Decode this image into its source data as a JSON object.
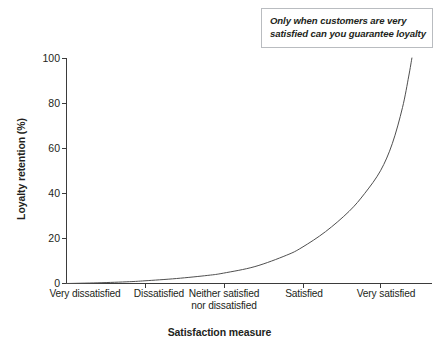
{
  "chart_data": {
    "type": "line",
    "title": "",
    "xlabel": "Satisfaction measure",
    "ylabel": "Loyalty retention (%)",
    "categories": [
      "Very dissatisfied",
      "Dissatisfied",
      "Neither satisfied nor dissatisfied",
      "Satisfied",
      "Very satisfied"
    ],
    "x": [
      1,
      2,
      3,
      4,
      5
    ],
    "values": [
      0,
      1,
      4,
      23,
      50
    ],
    "series": [
      {
        "name": "Loyalty retention",
        "values": [
          0,
          1,
          4,
          23,
          50
        ],
        "endpoint_value": 100,
        "color": "#4f4f4f"
      }
    ],
    "xlim": [
      0.75,
      5.4
    ],
    "ylim": [
      0,
      100
    ],
    "yticks": [
      0,
      20,
      40,
      60,
      80,
      100
    ],
    "ytick_labels": [
      "0",
      "20",
      "40",
      "60",
      "80",
      "100"
    ],
    "grid": false,
    "legend": "none",
    "curve_points": [
      {
        "x": 1.0,
        "y": 0.0
      },
      {
        "x": 1.4,
        "y": 0.3
      },
      {
        "x": 1.8,
        "y": 0.8
      },
      {
        "x": 2.0,
        "y": 1.2
      },
      {
        "x": 2.4,
        "y": 2.2
      },
      {
        "x": 2.8,
        "y": 3.6
      },
      {
        "x": 3.0,
        "y": 4.6
      },
      {
        "x": 3.4,
        "y": 7.5
      },
      {
        "x": 3.8,
        "y": 12.5
      },
      {
        "x": 4.0,
        "y": 16.0
      },
      {
        "x": 4.3,
        "y": 23.0
      },
      {
        "x": 4.6,
        "y": 32.0
      },
      {
        "x": 4.8,
        "y": 40.0
      },
      {
        "x": 5.0,
        "y": 50.0
      },
      {
        "x": 5.15,
        "y": 62.0
      },
      {
        "x": 5.28,
        "y": 78.0
      },
      {
        "x": 5.36,
        "y": 92.0
      },
      {
        "x": 5.4,
        "y": 100.0
      }
    ]
  },
  "annotation": {
    "line1": "Only when customers are very",
    "line2": "satisfied can you guarantee loyalty"
  },
  "axes": {
    "y_title": "Loyalty retention (%)",
    "x_title": "Satisfaction measure",
    "y_tick_labels": [
      "100",
      "80",
      "60",
      "40",
      "20",
      "0"
    ],
    "x_tick_labels": [
      {
        "line1": "Very dissatisfied",
        "line2": ""
      },
      {
        "line1": "Dissatisfied",
        "line2": ""
      },
      {
        "line1": "Neither satisfied",
        "line2": "nor dissatisfied"
      },
      {
        "line1": "Satisfied",
        "line2": ""
      },
      {
        "line1": "Very satisfied",
        "line2": ""
      }
    ]
  },
  "colors": {
    "axis": "#3b3b3b",
    "curve": "#4f4f4f",
    "text": "#231f20",
    "annotation_border": "#b9bcc0",
    "background": "#ffffff"
  }
}
